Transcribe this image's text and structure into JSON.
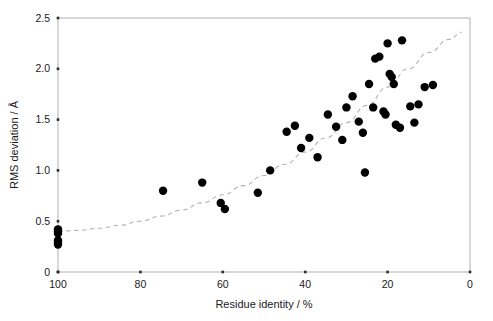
{
  "chart_data": {
    "type": "scatter",
    "title": "",
    "xlabel": "Residue identity / %",
    "ylabel": "RMS deviation / Å",
    "xlim": [
      100,
      0
    ],
    "ylim": [
      0,
      2.5
    ],
    "x_ticks": [
      100,
      80,
      60,
      40,
      20,
      0
    ],
    "x_tick_labels": [
      "100",
      "80",
      "60",
      "40",
      "20",
      "0"
    ],
    "y_ticks": [
      0,
      0.5,
      1.0,
      1.5,
      2.0,
      2.5
    ],
    "y_tick_labels": [
      "0",
      "0.5",
      "1.0",
      "1.5",
      "2.0",
      "2.5"
    ],
    "grid": false,
    "legend": null,
    "axis_reversed_x": true,
    "marker_color": "#000000",
    "marker_size": 4.2,
    "frame_color": "#b0b0b0",
    "series": [
      {
        "name": "Structure pairs",
        "marker": "filled-circle",
        "points": [
          [
            100,
            0.42
          ],
          [
            100,
            0.4
          ],
          [
            100,
            0.38
          ],
          [
            100,
            0.31
          ],
          [
            100,
            0.29
          ],
          [
            100,
            0.27
          ],
          [
            74.5,
            0.8
          ],
          [
            65.0,
            0.88
          ],
          [
            60.5,
            0.68
          ],
          [
            59.5,
            0.62
          ],
          [
            51.5,
            0.78
          ],
          [
            48.5,
            1.0
          ],
          [
            44.5,
            1.38
          ],
          [
            42.5,
            1.44
          ],
          [
            41.0,
            1.22
          ],
          [
            39.0,
            1.32
          ],
          [
            37.0,
            1.13
          ],
          [
            34.5,
            1.55
          ],
          [
            32.5,
            1.43
          ],
          [
            31.0,
            1.3
          ],
          [
            30.0,
            1.62
          ],
          [
            28.5,
            1.73
          ],
          [
            27.0,
            1.48
          ],
          [
            26.0,
            1.37
          ],
          [
            25.5,
            0.98
          ],
          [
            24.5,
            1.85
          ],
          [
            23.5,
            1.62
          ],
          [
            23.0,
            2.1
          ],
          [
            22.0,
            2.12
          ],
          [
            21.0,
            1.58
          ],
          [
            20.5,
            1.55
          ],
          [
            20.0,
            2.25
          ],
          [
            19.5,
            1.95
          ],
          [
            19.0,
            1.92
          ],
          [
            18.5,
            1.85
          ],
          [
            18.0,
            1.45
          ],
          [
            17.0,
            1.42
          ],
          [
            16.5,
            2.28
          ],
          [
            14.5,
            1.63
          ],
          [
            13.5,
            1.47
          ],
          [
            11.0,
            1.82
          ],
          [
            12.5,
            1.65
          ],
          [
            9.0,
            1.84
          ]
        ]
      }
    ],
    "trend": {
      "name": "fitted curve",
      "style": "dashed",
      "color": "#b3b3b3",
      "description": "exponential-like increase from RMSD ~0.40 at 100% identity to ~2.35 at 0% identity",
      "points": [
        [
          100,
          0.4
        ],
        [
          95,
          0.41
        ],
        [
          90,
          0.43
        ],
        [
          85,
          0.46
        ],
        [
          80,
          0.5
        ],
        [
          75,
          0.55
        ],
        [
          70,
          0.61
        ],
        [
          65,
          0.68
        ],
        [
          60,
          0.76
        ],
        [
          55,
          0.85
        ],
        [
          50,
          0.95
        ],
        [
          45,
          1.06
        ],
        [
          40,
          1.18
        ],
        [
          35,
          1.32
        ],
        [
          30,
          1.47
        ],
        [
          25,
          1.64
        ],
        [
          20,
          1.82
        ],
        [
          15,
          2.0
        ],
        [
          10,
          2.16
        ],
        [
          5,
          2.29
        ],
        [
          2,
          2.36
        ]
      ]
    }
  },
  "axes": {
    "x_title": "Residue identity / %",
    "y_title": "RMS deviation / Å"
  }
}
